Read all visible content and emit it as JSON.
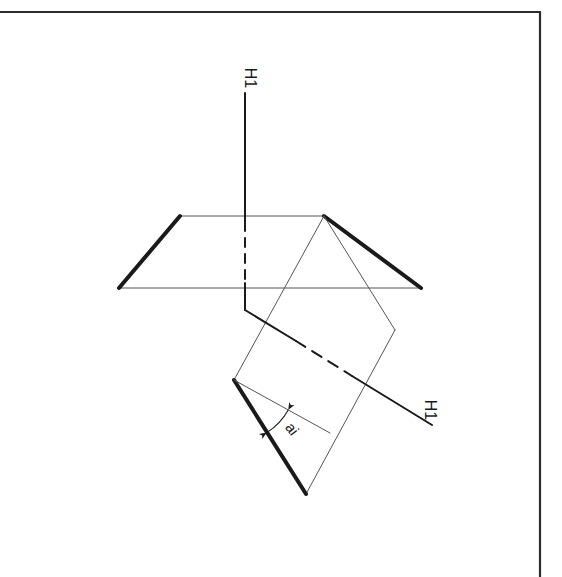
{
  "document": {
    "kind": "technical-drawing",
    "title": "Orthographic projection planes with dihedral angle",
    "background_color": "#ffffff",
    "ink_color": "#1a1a1a",
    "thin_color": "#555555",
    "width": 562,
    "height": 577
  },
  "border": {
    "name": "page-border-frame",
    "color": "#2b2b2b",
    "corner": {
      "x": 540,
      "y": 12
    },
    "top_edge": {
      "x1": 0,
      "y1": 12,
      "x2": 540,
      "y2": 12
    },
    "right_edge": {
      "x1": 540,
      "y1": 12,
      "x2": 540,
      "y2": 577
    },
    "stroke_width": 2.2
  },
  "labels": {
    "vertical_axis": {
      "text": "H1",
      "x": 245,
      "y": 78,
      "rotation": 90,
      "font_size": 16
    },
    "ground_axis": {
      "text": "H1",
      "x": 425,
      "y": 410,
      "rotation": 90,
      "font_size": 16
    },
    "angle": {
      "text": "ai",
      "x": 288,
      "y": 432,
      "rotation": 52,
      "font_size": 15
    }
  },
  "geometry": {
    "vertical_axis": {
      "name": "vertical-axis-line",
      "top": {
        "x": 245,
        "y": 93
      },
      "bottom": {
        "x": 245,
        "y": 310
      },
      "hidden_from": {
        "x": 245,
        "y": 222
      },
      "hidden_to": {
        "x": 245,
        "y": 283
      }
    },
    "horizontal_plane": {
      "name": "horizontal-projection-plane",
      "vertices": [
        {
          "x": 180,
          "y": 216
        },
        {
          "x": 324,
          "y": 216
        },
        {
          "x": 421,
          "y": 288
        },
        {
          "x": 119,
          "y": 288
        }
      ],
      "bold_edges": [
        [
          0,
          3
        ],
        [
          1,
          2
        ]
      ],
      "thin_edges": [
        [
          0,
          1
        ],
        [
          3,
          2
        ]
      ]
    },
    "inclined_plane": {
      "name": "inclined-projection-plane",
      "vertices": [
        {
          "x": 324,
          "y": 216
        },
        {
          "x": 234,
          "y": 380
        },
        {
          "x": 306,
          "y": 494
        },
        {
          "x": 395,
          "y": 330
        }
      ],
      "bold_edges": [
        [
          1,
          2
        ]
      ],
      "thin_edges": [
        [
          0,
          1
        ],
        [
          2,
          3
        ],
        [
          3,
          0
        ]
      ]
    },
    "ground_axis": {
      "name": "ground-line-axis",
      "start": {
        "x": 245,
        "y": 310
      },
      "end": {
        "x": 432,
        "y": 425
      },
      "hidden_from": {
        "x": 296,
        "y": 341
      },
      "hidden_to": {
        "x": 352,
        "y": 376
      }
    },
    "angle_reference_line": {
      "name": "angle-reference-line",
      "start": {
        "x": 234,
        "y": 380
      },
      "end": {
        "x": 330,
        "y": 433
      }
    },
    "angle_arc": {
      "name": "dihedral-angle-arc",
      "center": {
        "x": 234,
        "y": 380
      },
      "radius": 62,
      "start_angle_deg": 29,
      "end_angle_deg": 58
    }
  }
}
